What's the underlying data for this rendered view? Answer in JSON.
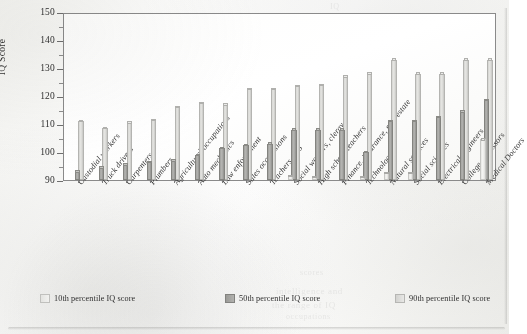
{
  "axis": {
    "y_title": "IQ Score",
    "y_ticks": [
      90,
      100,
      110,
      120,
      130,
      140,
      150
    ],
    "y_minor_ticks": [
      95,
      105,
      115,
      125,
      135,
      145
    ],
    "y_min": 90,
    "y_max": 150
  },
  "legend": {
    "items": [
      {
        "label": "10th percentile IQ score",
        "swatch": "s10",
        "color": "#ededea"
      },
      {
        "label": "50th percentile IQ score",
        "swatch": "s50",
        "color": "#a8a8a5"
      },
      {
        "label": "90th percentile IQ score",
        "swatch": "s90",
        "color": "#dcdcd9"
      }
    ]
  },
  "ghost_marks": {
    "a": "IQ",
    "b": "intelligence and",
    "c": "the range of IQ",
    "d": "occupations",
    "e": "scores"
  },
  "chart_data": {
    "type": "bar",
    "title": "",
    "xlabel": "",
    "ylabel": "IQ Score",
    "ylim": [
      90,
      150
    ],
    "grid": false,
    "legend_position": "bottom",
    "categories": [
      "Custodial workers",
      "Truck drivers",
      "Carpenters",
      "Plumbers",
      "Agricultural occupations",
      "Auto mechanics",
      "Law enforcement",
      "Sales occupations",
      "Teachers, K-5",
      "Social workers, clergy",
      "High school teachers",
      "Finance, insurance, real estate",
      "Technology",
      "Natural sciences",
      "Social sciences",
      "Electrical engineers",
      "College professors",
      "Medical Doctors"
    ],
    "series": [
      {
        "name": "10th percentile IQ score",
        "values": [
          90,
          90,
          90,
          90,
          90,
          90,
          90,
          90,
          90,
          91.5,
          91,
          90,
          91,
          92.5,
          92.5,
          90,
          90,
          104.5
        ]
      },
      {
        "name": "50th percentile IQ score",
        "values": [
          93,
          94.5,
          95.5,
          96.5,
          97,
          99,
          101.5,
          102.5,
          103,
          108,
          108,
          108,
          100,
          111,
          111,
          112.5,
          114.5,
          118.5
        ]
      },
      {
        "name": "90th percentile IQ score",
        "values": [
          111,
          108.5,
          110.5,
          111.5,
          116,
          117.5,
          117,
          122.5,
          122.5,
          123.5,
          124,
          127,
          128,
          133,
          128,
          128,
          133,
          133
        ]
      }
    ]
  }
}
